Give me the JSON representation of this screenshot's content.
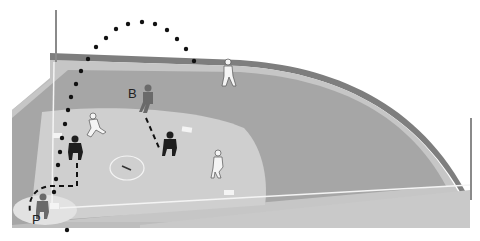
{
  "diagram": {
    "labels": {
      "batter": "B",
      "pitcher": "P"
    },
    "colors": {
      "background": "#ffffff",
      "wall": "#8a8a8a",
      "warning_track": "#c4c4c4",
      "outfield": "#a8a8a8",
      "infield": "#cfcfcf",
      "foul_ground": "#bdbdbd",
      "lines": "#f2f2f2",
      "dark_player": "#1e1e1e",
      "grey_player": "#6a6a6a",
      "light_player": "#f4f4f4",
      "trajectory": "#111111"
    },
    "players": [
      {
        "id": "batter-runner",
        "shade": "grey",
        "x": 145,
        "y": 98
      },
      {
        "id": "outfielder-deep",
        "shade": "light",
        "x": 228,
        "y": 72
      },
      {
        "id": "runner-left",
        "shade": "light",
        "x": 93,
        "y": 126
      },
      {
        "id": "fielder-dark-left",
        "shade": "dark",
        "x": 74,
        "y": 147
      },
      {
        "id": "fielder-dark-center",
        "shade": "dark",
        "x": 169,
        "y": 143
      },
      {
        "id": "fielder-light-right",
        "shade": "light",
        "x": 217,
        "y": 162
      },
      {
        "id": "pitcher-figure",
        "shade": "grey",
        "x": 42,
        "y": 207
      }
    ]
  }
}
